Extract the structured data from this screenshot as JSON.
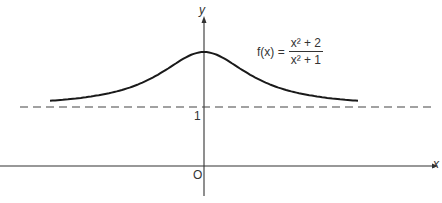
{
  "chart_data": {
    "type": "line",
    "title": "",
    "function": "f(x) = (x^2 + 2)/(x^2 + 1)",
    "formula_label": {
      "lhs": "f(x) =",
      "numerator": "x² + 2",
      "denominator": "x² + 1"
    },
    "xlabel": "x",
    "ylabel": "y",
    "origin_label": "O",
    "y_ticks": [
      {
        "value": 1,
        "label": "1"
      }
    ],
    "asymptote": {
      "y": 1,
      "style": "dashed",
      "label": "1"
    },
    "series": [
      {
        "name": "f(x)",
        "x": [
          -2.8,
          -2.5,
          -2.0,
          -1.5,
          -1.0,
          -0.5,
          0.0,
          0.5,
          1.0,
          1.5,
          2.0,
          2.5,
          2.8
        ],
        "values": [
          1.113,
          1.138,
          1.2,
          1.308,
          1.5,
          1.8,
          2.0,
          1.8,
          1.5,
          1.308,
          1.2,
          1.138,
          1.113
        ]
      }
    ],
    "xlim": [
      -3.7,
      4.3
    ],
    "ylim": [
      -0.5,
      3.0
    ],
    "grid": false,
    "legend": "none"
  },
  "colors": {
    "curve": "#1a1a1a",
    "axis": "#333333",
    "dashed": "#444444",
    "background": "#ffffff"
  }
}
